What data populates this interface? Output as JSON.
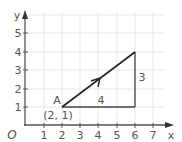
{
  "diagram": {
    "type": "coordinate-grid-vector",
    "axes": {
      "x_label": "x",
      "y_label": "y",
      "origin_label": "O",
      "x_ticks": [
        "1",
        "2",
        "3",
        "4",
        "5",
        "6",
        "7"
      ],
      "y_ticks": [
        "1",
        "2",
        "3",
        "4",
        "5"
      ]
    },
    "point_a": {
      "name": "A",
      "coords": "(2, 1)",
      "x": 2,
      "y": 1
    },
    "vector_end": {
      "x": 6,
      "y": 4
    },
    "horizontal_leg_label": "4",
    "vertical_leg_label": "3",
    "colors": {
      "grid": "#e6e6e6",
      "axis": "#555555",
      "vector": "#222222",
      "legs": "#444444"
    }
  }
}
